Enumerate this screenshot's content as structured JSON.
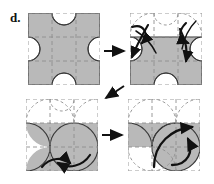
{
  "figure": {
    "label": "d.",
    "type": "diagram",
    "panel_count": 4,
    "grid_rows": 3,
    "grid_cols": 3
  },
  "colors": {
    "shade": "#b9b9b9",
    "shade_dark": "#a8a8a8",
    "stroke": "#2b2b2b",
    "dash": "#8e8e8e",
    "arrow": "#111111",
    "background": "#ffffff"
  },
  "panels": [
    {
      "id": "panel-top-left",
      "position": "top-left",
      "shaded_cells": [
        "r0c0",
        "r0c2",
        "r1c0",
        "r1c1",
        "r1c2",
        "r2c0",
        "r2c2"
      ],
      "curved_arrows": 0,
      "note": "initial configuration, full arc tiling shaded"
    },
    {
      "id": "panel-top-right",
      "position": "top-right",
      "shaded_cells": [
        "r1c0",
        "r1c1",
        "r1c2",
        "r2c0",
        "r2c2"
      ],
      "curved_arrows": 4,
      "note": "top row arcs unshaded, four curved arrows on left and right"
    },
    {
      "id": "panel-bottom-left",
      "position": "bottom-left",
      "shaded_cells": [
        "r1c0",
        "r1c1",
        "r1c2",
        "r2c0",
        "r2c1",
        "r2c2"
      ],
      "curved_arrows": 2,
      "note": "top row cleared, two curved arrows at bottom"
    },
    {
      "id": "panel-bottom-right",
      "position": "bottom-right",
      "shaded_cells": [
        "r1c0",
        "r1c1",
        "r1c2"
      ],
      "curved_arrows": 2,
      "note": "middle band shaded, two curved arrows center-right"
    }
  ],
  "connectors": [
    {
      "id": "arrow-tl-to-tr",
      "from": "panel-top-left",
      "to": "panel-top-right",
      "direction": "right"
    },
    {
      "id": "arrow-tr-to-bl",
      "from": "panel-top-right",
      "to": "panel-bottom-left",
      "direction": "down-left"
    },
    {
      "id": "arrow-bl-to-br",
      "from": "panel-bottom-left",
      "to": "panel-bottom-right",
      "direction": "right"
    }
  ]
}
